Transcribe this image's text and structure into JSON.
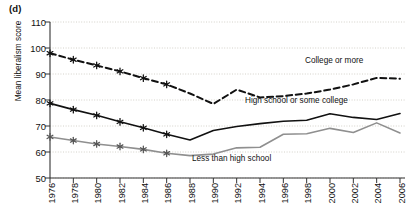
{
  "panel": {
    "label": "(d)"
  },
  "axes": {
    "ylabel": "Mean liberalism score",
    "yticks": [
      "110",
      "100",
      "90",
      "80",
      "70",
      "60",
      "50"
    ],
    "xticks": [
      "1976",
      "1978",
      "1980",
      "1982",
      "1984",
      "1986",
      "1988",
      "1990",
      "1992",
      "1994",
      "1996",
      "1998",
      "2000",
      "2002",
      "2004",
      "2006"
    ]
  },
  "annotations": {
    "college": "College or more",
    "highschool": "High school or some college",
    "lessthan": "Less than high school"
  },
  "chart_data": {
    "type": "line",
    "title": "",
    "xlabel": "",
    "ylabel": "Mean liberalism score",
    "ylim": [
      50,
      110
    ],
    "yticks": [
      50,
      60,
      70,
      80,
      90,
      100,
      110
    ],
    "grid": true,
    "legend": "inline-annotations",
    "x": [
      1976,
      1978,
      1980,
      1982,
      1984,
      1986,
      1988,
      1990,
      1992,
      1994,
      1996,
      1998,
      2000,
      2002,
      2004,
      2006
    ],
    "series": [
      {
        "name": "College or more",
        "style": "dashed",
        "color": "#111111",
        "markers": "asterisk",
        "marker_years": [
          1976,
          1978,
          1980,
          1982,
          1984,
          1986
        ],
        "values": [
          98.0,
          95.5,
          93.3,
          91.0,
          88.4,
          86.0,
          82.5,
          78.5,
          84.0,
          81.0,
          81.5,
          82.5,
          84.0,
          86.0,
          88.5,
          88.2
        ]
      },
      {
        "name": "High school or some college",
        "style": "solid",
        "color": "#111111",
        "markers": "asterisk",
        "marker_years": [
          1976,
          1978,
          1980,
          1982,
          1984,
          1986
        ],
        "values": [
          78.7,
          76.3,
          74.1,
          71.6,
          69.3,
          66.8,
          64.6,
          68.3,
          69.8,
          70.9,
          71.8,
          72.2,
          74.7,
          73.3,
          72.5,
          74.8
        ]
      },
      {
        "name": "Less than high school",
        "style": "solid",
        "color": "#8f8f8f",
        "markers": "asterisk",
        "marker_years": [
          1976,
          1978,
          1980,
          1982,
          1984,
          1986
        ],
        "values": [
          65.8,
          64.4,
          63.1,
          62.1,
          61.0,
          59.5,
          58.6,
          59.2,
          61.6,
          61.8,
          66.8,
          67.0,
          69.1,
          67.5,
          71.2,
          67.3
        ]
      }
    ]
  }
}
